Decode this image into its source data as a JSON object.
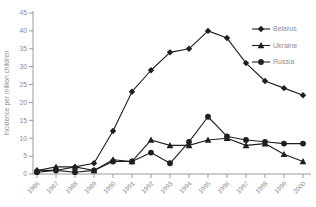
{
  "chart_data": {
    "type": "line",
    "title": "",
    "xlabel": "",
    "ylabel": "Incidence per million children",
    "x": [
      "1986",
      "1987",
      "1988",
      "1989",
      "1990",
      "1991",
      "1992",
      "1993",
      "1994",
      "1995",
      "1996",
      "1997",
      "1998",
      "1999",
      "2000"
    ],
    "ylim": [
      0,
      45
    ],
    "yticks": [
      0,
      5,
      10,
      15,
      20,
      25,
      30,
      35,
      40,
      45
    ],
    "grid": false,
    "legend_position": "top-right",
    "series": [
      {
        "name": "Belarus",
        "marker": "diamond",
        "values": [
          1,
          1,
          2,
          3,
          12,
          23,
          29,
          34,
          35,
          40,
          38,
          31,
          26,
          24,
          22
        ]
      },
      {
        "name": "Ukraine",
        "marker": "triangle",
        "values": [
          1,
          2,
          2,
          1,
          4,
          3.5,
          9.5,
          8,
          8,
          9.5,
          10,
          8,
          8.5,
          5.5,
          3.5
        ]
      },
      {
        "name": "Russia",
        "marker": "circle",
        "values": [
          0.5,
          1,
          0.5,
          1,
          3.5,
          3.5,
          6,
          3,
          9,
          16,
          10.5,
          9.5,
          9,
          8.5,
          8.5
        ]
      }
    ],
    "colors": {
      "series_line": "#1f1f1f",
      "marker_fill": "#1f1f1f",
      "axis_line": "#9a9a9a",
      "text": "#8e8e8e",
      "background": "#ffffff"
    }
  }
}
